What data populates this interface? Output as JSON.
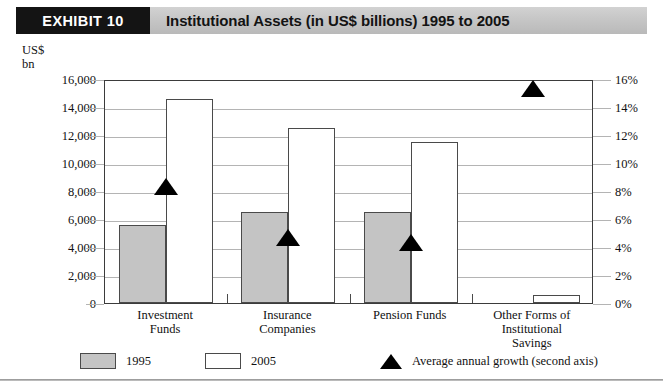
{
  "header": {
    "exhibit_tag": "EXHIBIT 10",
    "title": "Institutional Assets (in US$ billions) 1995 to 2005"
  },
  "axes": {
    "left_unit_caption": "US$\nbn",
    "left_ticks": [
      "16,000",
      "14,000",
      "12,000",
      "10,000",
      "8,000",
      "6,000",
      "4,000",
      "2,000",
      "0"
    ],
    "right_ticks": [
      "16%",
      "14%",
      "12%",
      "10%",
      "8%",
      "6%",
      "4%",
      "2%",
      "0%"
    ]
  },
  "legend": {
    "items": [
      {
        "label": "1995",
        "icon": "gray-square-swatch"
      },
      {
        "label": "2005",
        "icon": "white-square-swatch"
      },
      {
        "label": "Average annual growth (second axis)",
        "icon": "black-triangle-marker"
      }
    ]
  },
  "colors": {
    "bar_1995_fill": "#c4c4c4",
    "bar_2005_fill": "#ffffff",
    "bar_stroke": "#4a4a4a",
    "marker": "#000000",
    "grid": "#b4b4b4",
    "band": "#c6c6c6",
    "tag_bg": "#141414"
  },
  "chart_data": {
    "type": "bar",
    "title": "Institutional Assets (in US$ billions) 1995 to 2005",
    "subtitle": "",
    "xlabel": "",
    "ylabel": "US$ bn",
    "y2label": "Average annual growth",
    "categories": [
      "Investment\nFunds",
      "Insurance\nCompanies",
      "Pension Funds",
      "Other Forms of\nInstitutional\nSavings"
    ],
    "series": [
      {
        "name": "1995",
        "axis": "left",
        "values": [
          5600,
          6500,
          6500,
          null
        ]
      },
      {
        "name": "2005",
        "axis": "left",
        "values": [
          14600,
          12500,
          11500,
          600
        ]
      },
      {
        "name": "Average annual growth (second axis)",
        "axis": "right",
        "type": "scatter-triangle",
        "values": [
          8.5,
          4.8,
          4.5,
          15.5
        ]
      }
    ],
    "ylim": [
      0,
      16000
    ],
    "yticks": [
      0,
      2000,
      4000,
      6000,
      8000,
      10000,
      12000,
      14000,
      16000
    ],
    "y2lim": [
      0,
      16
    ],
    "y2ticks": [
      0,
      2,
      4,
      6,
      8,
      10,
      12,
      14,
      16
    ],
    "grid": true,
    "legend_position": "bottom"
  }
}
